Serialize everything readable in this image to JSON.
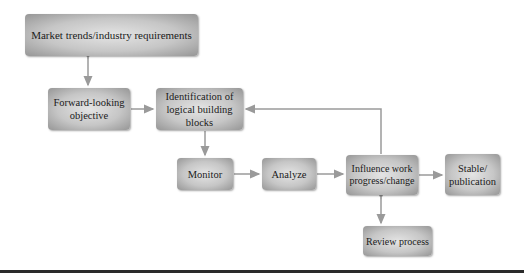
{
  "diagram": {
    "nodes": [
      {
        "id": "market",
        "label": "Market trends/industry requirements"
      },
      {
        "id": "forward",
        "label": "Forward-looking objective"
      },
      {
        "id": "identification",
        "label": "Identification of logical building blocks"
      },
      {
        "id": "monitor",
        "label": "Monitor"
      },
      {
        "id": "analyze",
        "label": "Analyze"
      },
      {
        "id": "influence",
        "label": "Influence work progress/change"
      },
      {
        "id": "stable",
        "label": "Stable/ publication"
      },
      {
        "id": "review",
        "label": "Review process"
      }
    ],
    "edges": [
      {
        "from": "market",
        "to": "forward",
        "type": "bidirectional"
      },
      {
        "from": "forward",
        "to": "identification",
        "type": "directed"
      },
      {
        "from": "identification",
        "to": "monitor",
        "type": "directed"
      },
      {
        "from": "monitor",
        "to": "analyze",
        "type": "directed"
      },
      {
        "from": "analyze",
        "to": "influence",
        "type": "directed"
      },
      {
        "from": "influence",
        "to": "stable",
        "type": "directed"
      },
      {
        "from": "influence",
        "to": "identification",
        "type": "directed"
      },
      {
        "from": "influence",
        "to": "review",
        "type": "bidirectional"
      }
    ],
    "colors": {
      "arrow": "#9a9a9a",
      "box_center": "#e4e4e4",
      "box_edge": "#969696",
      "rule": "#2a2a2a"
    }
  }
}
